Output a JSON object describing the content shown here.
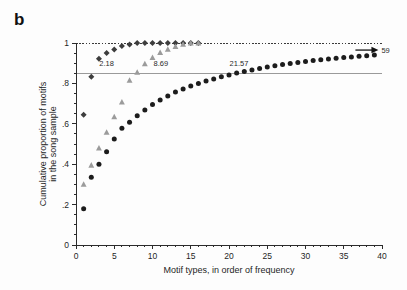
{
  "figure": {
    "panel_label": "b",
    "background_color": "#fdfdfd"
  },
  "chart_data": {
    "type": "scatter",
    "title": "",
    "xlabel": "Motif types, in order of frequency",
    "ylabel": "Cumulative proportion of motifs in the song sample",
    "ylabel_line1": "Cumulative proportion of motifs",
    "ylabel_line2": "in the song sample",
    "xlim": [
      0,
      40
    ],
    "ylim": [
      0,
      1
    ],
    "xticks": [
      0,
      5,
      10,
      15,
      20,
      25,
      30,
      35,
      40
    ],
    "xticklabels": [
      "0",
      "5",
      "10",
      "15",
      "20",
      "25",
      "30",
      "35",
      "40"
    ],
    "yticks": [
      0,
      0.2,
      0.4,
      0.6,
      0.8,
      1
    ],
    "yticklabels": [
      "0",
      ".2",
      ".4",
      ".6",
      ".8",
      "1"
    ],
    "grid": false,
    "legend": "none",
    "reference_lines": [
      {
        "name": "criterion-line",
        "orientation": "horizontal",
        "y": 0.85,
        "style": "solid",
        "color": "#9a9a9a"
      },
      {
        "name": "ceiling-line",
        "orientation": "horizontal",
        "y": 1.0,
        "style": "dotted",
        "color": "#3a3a3a"
      }
    ],
    "annotations": [
      {
        "name": "mean-small-repertoire",
        "text": "2.18",
        "x": 4.0,
        "y": 0.885
      },
      {
        "name": "mean-medium-repertoire",
        "text": "8.69",
        "x": 11.1,
        "y": 0.885
      },
      {
        "name": "mean-large-repertoire",
        "text": "21.57",
        "x": 21.3,
        "y": 0.885
      },
      {
        "name": "sample-size-arrow-label",
        "text": "59",
        "x": 39.4,
        "y": 0.965
      }
    ],
    "series": [
      {
        "name": "small-repertoire",
        "marker": "diamond",
        "color": "#3d3d3d",
        "x": [
          1,
          2,
          3,
          4,
          5,
          6,
          7,
          8,
          9,
          10,
          11,
          12,
          13,
          14,
          15,
          16
        ],
        "values": [
          0.645,
          0.833,
          0.922,
          0.951,
          0.968,
          0.985,
          0.993,
          1.0,
          1.0,
          1.0,
          1.0,
          1.0,
          1.0,
          1.0,
          1.0,
          1.0
        ]
      },
      {
        "name": "medium-repertoire",
        "marker": "triangle",
        "color": "#9b9b9b",
        "x": [
          1,
          2,
          3,
          4,
          5,
          6,
          7,
          8,
          9,
          10,
          11,
          12,
          13,
          14,
          15,
          16
        ],
        "values": [
          0.3,
          0.395,
          0.48,
          0.558,
          0.635,
          0.707,
          0.815,
          0.855,
          0.897,
          0.928,
          0.952,
          0.969,
          0.982,
          0.993,
          1.0,
          1.0
        ]
      },
      {
        "name": "large-repertoire",
        "marker": "circle",
        "color": "#1c1c1c",
        "x": [
          1,
          2,
          3,
          4,
          5,
          6,
          7,
          8,
          9,
          10,
          11,
          12,
          13,
          14,
          15,
          16,
          17,
          18,
          19,
          20,
          21,
          22,
          23,
          24,
          25,
          26,
          27,
          28,
          29,
          30,
          31,
          32,
          33,
          34,
          35,
          36,
          37,
          38,
          39
        ],
        "values": [
          0.18,
          0.335,
          0.4,
          0.462,
          0.525,
          0.578,
          0.608,
          0.64,
          0.668,
          0.695,
          0.718,
          0.738,
          0.757,
          0.772,
          0.787,
          0.8,
          0.812,
          0.822,
          0.833,
          0.842,
          0.851,
          0.859,
          0.866,
          0.874,
          0.881,
          0.887,
          0.893,
          0.898,
          0.903,
          0.908,
          0.913,
          0.917,
          0.921,
          0.925,
          0.928,
          0.931,
          0.934,
          0.937,
          0.94
        ]
      }
    ]
  }
}
